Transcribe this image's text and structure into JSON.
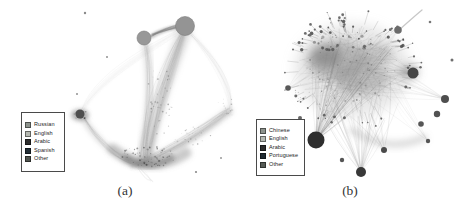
{
  "figure": {
    "background": "#ffffff",
    "panels": [
      {
        "id": "a",
        "caption": "(a)",
        "legend": {
          "x": 21,
          "y": 112,
          "width": 44,
          "height": 60,
          "items": [
            {
              "label": "Russian",
              "color": "#8d928c"
            },
            {
              "label": "English",
              "color": "#b5b8b1"
            },
            {
              "label": "Arabic",
              "color": "#2d2d2d"
            },
            {
              "label": "Spanish",
              "color": "#232e36"
            },
            {
              "label": "Other",
              "color": "#50544f"
            }
          ]
        }
      },
      {
        "id": "b",
        "caption": "(b)",
        "legend": {
          "x": 256,
          "y": 119,
          "width": 49,
          "height": 57,
          "items": [
            {
              "label": "Chinese",
              "color": "#8d928c"
            },
            {
              "label": "English",
              "color": "#b5b8b1"
            },
            {
              "label": "Arabic",
              "color": "#2d2d2d"
            },
            {
              "label": "Portuguese",
              "color": "#1f2a31"
            },
            {
              "label": "Other",
              "color": "#565b56"
            }
          ]
        }
      }
    ],
    "network_a": {
      "seed": 13,
      "washes": [
        {
          "d": "M 185,30 C 167,78 152,116 146,158",
          "w": 15,
          "color": "#a6a6a6",
          "opacity": 0.3,
          "blur": 2.5
        },
        {
          "d": "M 185,30 C 170,78 156,118 149,156",
          "w": 6,
          "color": "#8c8c8c",
          "opacity": 0.28,
          "blur": 1.5
        },
        {
          "d": "M 145,42 C 153,78 149,118 142,154",
          "w": 9,
          "color": "#a9a9a9",
          "opacity": 0.28,
          "blur": 2
        },
        {
          "d": "M 140,162 C 174,152 206,130 229,111",
          "w": 9,
          "color": "#a2a2a2",
          "opacity": 0.3,
          "blur": 2
        },
        {
          "d": "M 132,166 C 166,157 202,135 227,113",
          "w": 4,
          "color": "#8a8a8a",
          "opacity": 0.25,
          "blur": 1.5
        },
        {
          "d": "M 83,118 C 97,141 116,156 134,163",
          "w": 7,
          "color": "#a5a5a5",
          "opacity": 0.3,
          "blur": 2
        },
        {
          "d": "M 152,36 C 162,30 170,28 178,27",
          "w": 4.5,
          "color": "#8f8f8f",
          "opacity": 0.5,
          "blur": 1
        },
        {
          "d": "M 183,28 C 129,62 94,86 82,112",
          "w": 2,
          "color": "#b0b0b0",
          "opacity": 0.2,
          "blur": 1.5
        },
        {
          "d": "M 188,31 C 224,66 233,96 229,115",
          "w": 2.5,
          "color": "#b0b0b0",
          "opacity": 0.2,
          "blur": 1.5
        },
        {
          "d": "M 113,149 C 136,167 162,169 186,153",
          "w": 11,
          "color": "#7a7a7a",
          "opacity": 0.4,
          "blur": 2.5
        },
        {
          "d": "M 126,158 C 141,168 156,167 171,158",
          "w": 7,
          "color": "#5d5d5d",
          "opacity": 0.45,
          "blur": 2
        },
        {
          "ellipse": [
            80,
            115,
            9,
            6
          ],
          "color": "#6a6a6a",
          "opacity": 0.5,
          "blur": 2
        }
      ],
      "bundles": [
        {
          "p": [
            185,
            28,
            166,
            80,
            150,
            120,
            146,
            160
          ],
          "count": 26,
          "jitter": 11,
          "color": "#8a8a8a",
          "opacity": 0.1,
          "wmin": 0.4,
          "wmax": 1.0
        },
        {
          "p": [
            145,
            40,
            154,
            80,
            147,
            120,
            141,
            157
          ],
          "count": 16,
          "jitter": 7,
          "color": "#8a8a8a",
          "opacity": 0.1,
          "wmin": 0.4,
          "wmax": 0.9
        },
        {
          "p": [
            140,
            162,
            175,
            150,
            205,
            128,
            229,
            110
          ],
          "count": 20,
          "jitter": 8,
          "color": "#8a8a8a",
          "opacity": 0.1,
          "wmin": 0.4,
          "wmax": 0.9
        },
        {
          "p": [
            83,
            117,
            97,
            140,
            112,
            154,
            133,
            162
          ],
          "count": 13,
          "jitter": 6,
          "color": "#8a8a8a",
          "opacity": 0.12,
          "wmin": 0.4,
          "wmax": 0.9
        },
        {
          "p": [
            151,
            36,
            161,
            31,
            170,
            28,
            178,
            27
          ],
          "count": 9,
          "jitter": 2.5,
          "color": "#7d7d7d",
          "opacity": 0.3,
          "wmin": 0.5,
          "wmax": 1.4
        },
        {
          "p": [
            184,
            28,
            128,
            62,
            93,
            87,
            82,
            112
          ],
          "count": 5,
          "jitter": 7,
          "color": "#9a9a9a",
          "opacity": 0.09,
          "wmin": 0.3,
          "wmax": 0.7
        },
        {
          "p": [
            187,
            30,
            223,
            66,
            233,
            96,
            229,
            114
          ],
          "count": 6,
          "jitter": 6,
          "color": "#9a9a9a",
          "opacity": 0.09,
          "wmin": 0.3,
          "wmax": 0.7
        },
        {
          "p": [
            138,
            166,
            143,
            172,
            148,
            176,
            152,
            180
          ],
          "count": 6,
          "jitter": 5,
          "color": "#9a9a9a",
          "opacity": 0.15,
          "wmin": 0.3,
          "wmax": 0.6
        }
      ],
      "speckles": [
        {
          "e": [
            147,
            157,
            28,
            11
          ],
          "count": 70,
          "rmin": 0.3,
          "rmax": 1.1,
          "color": "#4a4a4a",
          "opacity": 0.55
        },
        {
          "e": [
            160,
            100,
            13,
            36
          ],
          "count": 42,
          "rmin": 0.3,
          "rmax": 0.9,
          "color": "#6b6b6b",
          "opacity": 0.45
        },
        {
          "e": [
            193,
            136,
            24,
            9
          ],
          "count": 26,
          "rmin": 0.3,
          "rmax": 0.9,
          "color": "#6b6b6b",
          "opacity": 0.45
        },
        {
          "e": [
            225,
            108,
            9,
            13
          ],
          "count": 14,
          "rmin": 0.3,
          "rmax": 0.9,
          "color": "#6b6b6b",
          "opacity": 0.45
        },
        {
          "e": [
            81,
            115,
            7,
            5
          ],
          "count": 20,
          "rmin": 0.3,
          "rmax": 1.0,
          "color": "#3f3f3f",
          "opacity": 0.6
        }
      ],
      "nodes": [
        {
          "x": 185,
          "y": 26,
          "r": 9.5,
          "color": "#949494",
          "stroke": "#7c7c7c"
        },
        {
          "x": 144,
          "y": 38,
          "r": 7,
          "color": "#989898",
          "stroke": "#7c7c7c"
        },
        {
          "x": 80,
          "y": 114,
          "r": 4.5,
          "color": "#4f4f4f"
        },
        {
          "x": 85,
          "y": 13,
          "r": 1.2,
          "color": "#8a8a8a"
        },
        {
          "x": 107,
          "y": 57,
          "r": 1.0,
          "color": "#909090"
        },
        {
          "x": 77,
          "y": 94,
          "r": 1.0,
          "color": "#909090"
        },
        {
          "x": 196,
          "y": 172,
          "r": 1.1,
          "color": "#8a8a8a"
        },
        {
          "x": 221,
          "y": 158,
          "r": 1.0,
          "color": "#999999"
        }
      ]
    },
    "network_b": {
      "seed": 29,
      "washes": [
        {
          "ellipse": [
            352,
            70,
            58,
            47
          ],
          "color": "#c2c2c2",
          "opacity": 0.38,
          "blur": 6
        },
        {
          "ellipse": [
            337,
            60,
            30,
            20
          ],
          "color": "#8a8a8a",
          "opacity": 0.5,
          "blur": 5
        },
        {
          "ellipse": [
            362,
            78,
            27,
            17
          ],
          "color": "#8f8f8f",
          "opacity": 0.45,
          "blur": 5
        },
        {
          "ellipse": [
            327,
            57,
            15,
            10
          ],
          "color": "#6b6b6b",
          "opacity": 0.5,
          "blur": 4
        },
        {
          "ellipse": [
            375,
            55,
            18,
            11
          ],
          "color": "#909090",
          "opacity": 0.4,
          "blur": 4
        },
        {
          "ellipse": [
            409,
            72,
            10,
            8
          ],
          "color": "#777777",
          "opacity": 0.45,
          "blur": 4
        },
        {
          "d": "M 352,130 C 375,146 400,148 424,138",
          "w": 7,
          "color": "#8a8a8a",
          "opacity": 0.3,
          "blur": 3
        },
        {
          "d": "M 316,140 C 330,112 344,92 358,78",
          "w": 6,
          "color": "#9a9a9a",
          "opacity": 0.25,
          "blur": 3
        },
        {
          "d": "M 398,31 C 408,22 416,15 422,10",
          "w": 1.2,
          "color": "#8f8f8f",
          "opacity": 0.5,
          "blur": 0.6
        }
      ],
      "chords": {
        "e": [
          352,
          70,
          54,
          45
        ],
        "count": 170,
        "color": "#9d9d9d",
        "opacity": 0.22,
        "wmin": 0.3,
        "wmax": 0.7
      },
      "fans": [
        {
          "from": [
            316,
            140
          ],
          "e": [
            355,
            68,
            46,
            36
          ],
          "count": 40,
          "color": "#6e6e6e",
          "opacity": 0.22,
          "wmin": 0.35,
          "wmax": 0.8
        },
        {
          "from": [
            361,
            172
          ],
          "e": [
            357,
            95,
            45,
            32
          ],
          "count": 28,
          "color": "#757575",
          "opacity": 0.2,
          "wmin": 0.3,
          "wmax": 0.7
        },
        {
          "from": [
            413,
            73
          ],
          "e": [
            362,
            66,
            34,
            24
          ],
          "count": 16,
          "color": "#7a7a7a",
          "opacity": 0.2,
          "wmin": 0.3,
          "wmax": 0.7
        },
        {
          "from": [
            445,
            99
          ],
          "e": [
            382,
            76,
            30,
            24
          ],
          "count": 11,
          "color": "#858585",
          "opacity": 0.18,
          "wmin": 0.3,
          "wmax": 0.6
        },
        {
          "from": [
            398,
            30
          ],
          "e": [
            362,
            60,
            26,
            18
          ],
          "count": 8,
          "color": "#8a8a8a",
          "opacity": 0.18,
          "wmin": 0.3,
          "wmax": 0.6
        },
        {
          "from": [
            288,
            88
          ],
          "e": [
            332,
            66,
            26,
            20
          ],
          "count": 8,
          "color": "#8a8a8a",
          "opacity": 0.18,
          "wmin": 0.3,
          "wmax": 0.6
        },
        {
          "from": [
            384,
            150
          ],
          "e": [
            366,
            92,
            34,
            26
          ],
          "count": 9,
          "color": "#858585",
          "opacity": 0.18,
          "wmin": 0.3,
          "wmax": 0.6
        },
        {
          "from": [
            428,
            141
          ],
          "e": [
            390,
            90,
            30,
            24
          ],
          "count": 8,
          "color": "#8a8a8a",
          "opacity": 0.16,
          "wmin": 0.3,
          "wmax": 0.6
        }
      ],
      "spikes": [
        {
          "e": [
            352,
            68,
            55,
            46
          ],
          "count": 58,
          "lmin": 3,
          "lmax": 15,
          "color": "#8d8d8d",
          "opacity": 0.55,
          "dotMin": 0.5,
          "dotMax": 1.5,
          "dotColor": "#555555"
        },
        {
          "e": [
            350,
            50,
            46,
            18
          ],
          "count": 26,
          "lmin": 3,
          "lmax": 12,
          "color": "#7f7f7f",
          "opacity": 0.6,
          "dotMin": 0.7,
          "dotMax": 1.8,
          "dotColor": "#4a4a4a",
          "up": true
        }
      ],
      "speckles": [
        {
          "e": [
            352,
            68,
            46,
            36
          ],
          "count": 85,
          "rmin": 0.3,
          "rmax": 1.0,
          "color": "#565656",
          "opacity": 0.5
        },
        {
          "e": [
            345,
            43,
            38,
            8
          ],
          "count": 22,
          "rmin": 0.7,
          "rmax": 1.7,
          "color": "#474747",
          "opacity": 0.7
        },
        {
          "e": [
            320,
            95,
            30,
            18
          ],
          "count": 25,
          "rmin": 0.3,
          "rmax": 0.9,
          "color": "#5f5f5f",
          "opacity": 0.45
        }
      ],
      "nodes": [
        {
          "x": 316,
          "y": 140,
          "r": 8.5,
          "color": "#2e2e2e"
        },
        {
          "x": 361,
          "y": 172,
          "r": 5.0,
          "color": "#383838"
        },
        {
          "x": 413,
          "y": 73,
          "r": 5.5,
          "color": "#454545"
        },
        {
          "x": 445,
          "y": 99,
          "r": 4.0,
          "color": "#4e4e4e"
        },
        {
          "x": 437,
          "y": 114,
          "r": 3.2,
          "color": "#525252"
        },
        {
          "x": 421,
          "y": 124,
          "r": 2.8,
          "color": "#565656"
        },
        {
          "x": 398,
          "y": 30,
          "r": 3.8,
          "color": "#6b6b6b"
        },
        {
          "x": 288,
          "y": 88,
          "r": 2.8,
          "color": "#585858"
        },
        {
          "x": 384,
          "y": 150,
          "r": 3.0,
          "color": "#4a4a4a"
        },
        {
          "x": 428,
          "y": 141,
          "r": 2.2,
          "color": "#555555"
        },
        {
          "x": 342,
          "y": 160,
          "r": 2.2,
          "color": "#555555"
        },
        {
          "x": 300,
          "y": 118,
          "r": 2.0,
          "color": "#666666"
        },
        {
          "x": 452,
          "y": 60,
          "r": 1.5,
          "color": "#6f6f6f"
        },
        {
          "x": 430,
          "y": 22,
          "r": 1.3,
          "color": "#777777"
        },
        {
          "x": 310,
          "y": 35,
          "r": 1.5,
          "color": "#6a6a6a"
        }
      ]
    }
  }
}
